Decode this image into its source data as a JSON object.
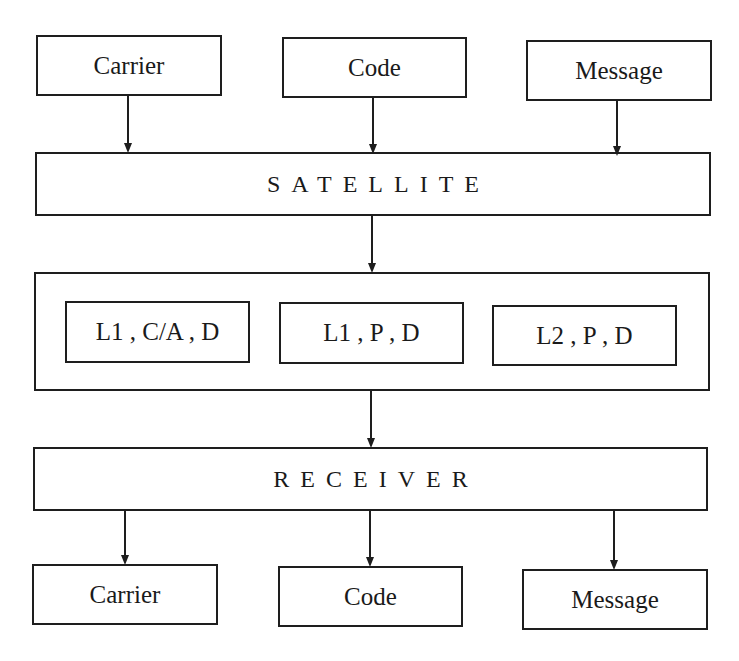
{
  "diagram": {
    "inputs": [
      {
        "label": "Carrier"
      },
      {
        "label": "Code"
      },
      {
        "label": "Message"
      }
    ],
    "satellite": {
      "label": "SATELLITE"
    },
    "signals": {
      "components": [
        {
          "label": "L1 , C/A , D"
        },
        {
          "label": "L1 , P , D"
        },
        {
          "label": "L2 , P , D"
        }
      ]
    },
    "receiver": {
      "label": "RECEIVER"
    },
    "outputs": [
      {
        "label": "Carrier"
      },
      {
        "label": "Code"
      },
      {
        "label": "Message"
      }
    ],
    "colors": {
      "line": "#1e1e1e",
      "background": "#ffffff"
    }
  }
}
